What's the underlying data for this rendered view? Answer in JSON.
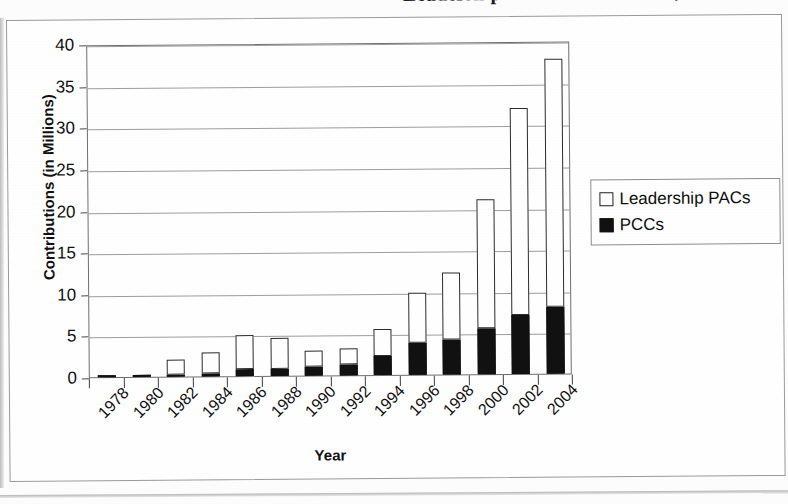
{
  "document": {
    "title_clipped": "Leadership PAC Contributions, 1978-2004",
    "x_axis_title": "Year",
    "y_axis_title": "Contributions (in Millions)"
  },
  "legend": {
    "position": "right",
    "entries": [
      {
        "label": "Leadership PACs",
        "swatch": "white-square-outline",
        "color": "#ffffff"
      },
      {
        "label": "PCCs",
        "swatch": "black-filled-square",
        "color": "#111111"
      }
    ]
  },
  "chart_data": {
    "type": "bar",
    "stacked": true,
    "title": "Leadership PAC Contributions, 1978-2004",
    "xlabel": "Year",
    "ylabel": "Contributions (in Millions)",
    "ylim": [
      0,
      40
    ],
    "yticks": [
      0,
      5,
      10,
      15,
      20,
      25,
      30,
      35,
      40
    ],
    "ytick_labels": [
      "0",
      "5",
      "10",
      "15",
      "20",
      "25",
      "30",
      "35",
      "40"
    ],
    "grid": true,
    "legend_position": "right",
    "categories": [
      "1978",
      "1980",
      "1982",
      "1984",
      "1986",
      "1988",
      "1990",
      "1992",
      "1994",
      "1996",
      "1998",
      "2000",
      "2002",
      "2004"
    ],
    "series": [
      {
        "name": "PCCs",
        "color": "#111111",
        "values": [
          0.3,
          0.15,
          0.3,
          0.4,
          0.9,
          0.9,
          1.1,
          1.3,
          2.3,
          3.8,
          4.2,
          5.5,
          7.1,
          8.0
        ]
      },
      {
        "name": "Leadership PACs",
        "color": "#ffffff",
        "values": [
          0.0,
          0.0,
          1.7,
          2.5,
          4.0,
          3.7,
          1.9,
          2.0,
          3.2,
          6.0,
          8.0,
          15.5,
          24.9,
          29.8
        ]
      }
    ],
    "totals": [
      0.3,
      0.15,
      2.0,
      2.9,
      4.9,
      4.6,
      3.0,
      3.3,
      5.5,
      9.8,
      12.2,
      21.0,
      32.0,
      37.8
    ]
  }
}
